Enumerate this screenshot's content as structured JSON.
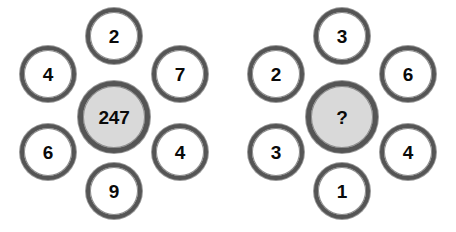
{
  "diagram": {
    "type": "number-rosette-puzzle",
    "background_color": "#ffffff",
    "ring_color": "#555555",
    "center_fill_color": "#d9d9d9",
    "satellite_fill_color": "#ffffff",
    "text_color": "#0a0a0a"
  },
  "puzzles": [
    {
      "name": "left-puzzle",
      "center": {
        "label": "247",
        "position": "center",
        "is_unknown": false
      },
      "satellites": [
        {
          "label": "2",
          "position": "top"
        },
        {
          "label": "7",
          "position": "upper-right"
        },
        {
          "label": "4",
          "position": "lower-right"
        },
        {
          "label": "9",
          "position": "bottom"
        },
        {
          "label": "6",
          "position": "lower-left"
        },
        {
          "label": "4",
          "position": "upper-left"
        }
      ]
    },
    {
      "name": "right-puzzle",
      "center": {
        "label": "?",
        "position": "center",
        "is_unknown": true
      },
      "satellites": [
        {
          "label": "3",
          "position": "top"
        },
        {
          "label": "6",
          "position": "upper-right"
        },
        {
          "label": "4",
          "position": "lower-right"
        },
        {
          "label": "1",
          "position": "bottom"
        },
        {
          "label": "3",
          "position": "lower-left"
        },
        {
          "label": "2",
          "position": "upper-left"
        }
      ]
    }
  ]
}
